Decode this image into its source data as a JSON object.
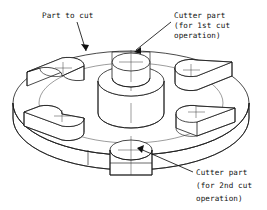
{
  "figure": {
    "type": "isometric-engineering-drawing",
    "background_color": "#ffffff",
    "line_color": "#1a1a1a",
    "text_color": "#111111"
  },
  "annotations": [
    {
      "id": "part-to-cut",
      "lines": [
        "Part to cut"
      ],
      "text_x": 42,
      "text_y": 18,
      "leader": "M 77 22 L 86 51",
      "arrow_x": 86,
      "arrow_y": 51,
      "points_to": "disc-rim-top"
    },
    {
      "id": "cutter-part-1st",
      "lines": [
        "Cutter part",
        "(for 1st cut",
        "operation)"
      ],
      "text_x": 174,
      "text_y": 18,
      "leader": "M 171 22 L 136 50",
      "arrow_x": 136,
      "arrow_y": 50,
      "points_to": "slot-pocket-top-center"
    },
    {
      "id": "cutter-part-2nd",
      "lines": [
        "Cutter part",
        "(for 2nd cut",
        "operation)"
      ],
      "text_x": 196,
      "text_y": 175,
      "leader": "M 193 172 L 138 148",
      "arrow_x": 138,
      "arrow_y": 148,
      "points_to": "round-pocket-bottom-center"
    }
  ],
  "geometry": {
    "disc": {
      "center_x": 131,
      "center_y": 103,
      "radius_x": 118,
      "radius_y": 52,
      "thickness": 26,
      "inner_ring_radius_x": 92,
      "inner_ring_radius_y": 40
    },
    "center_boss": {
      "center_x": 131,
      "center_y": 113,
      "radius_x": 33,
      "radius_y": 15,
      "height": 32
    },
    "round_pockets": [
      {
        "id": "pocket-top-center",
        "cx": 131,
        "cy": 62,
        "rx": 19,
        "ry": 9,
        "depth": 20
      },
      {
        "id": "pocket-bottom-center",
        "cx": 131,
        "cy": 150,
        "rx": 21,
        "ry": 10,
        "depth": 22
      }
    ],
    "slot_pockets": [
      {
        "id": "slot-upper-left",
        "cx": 58,
        "cy": 76
      },
      {
        "id": "slot-lower-left",
        "cx": 57,
        "cy": 122
      },
      {
        "id": "slot-upper-right",
        "cx": 204,
        "cy": 77
      },
      {
        "id": "slot-lower-right",
        "cx": 205,
        "cy": 123
      }
    ]
  }
}
